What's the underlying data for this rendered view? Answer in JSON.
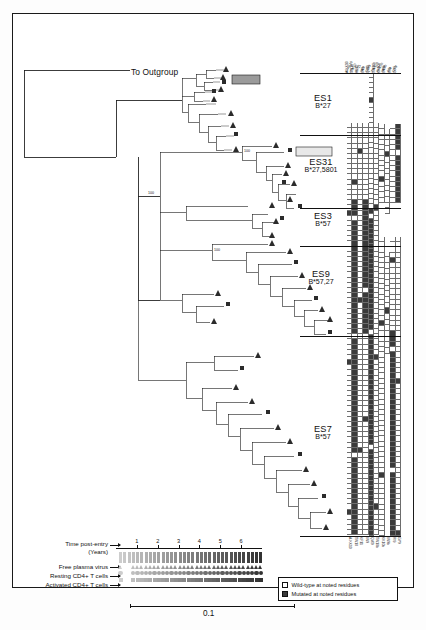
{
  "figure": {
    "type": "phylogenetic-tree-with-mutation-matrix",
    "outgroup_label": "To Outgroup",
    "bootstrap_values": [
      "100",
      "100",
      "100"
    ]
  },
  "groups": [
    {
      "id": "ES1",
      "name": "ES1",
      "hla": "B*27"
    },
    {
      "id": "ES31",
      "name": "ES31",
      "hla": "B*27,5801"
    },
    {
      "id": "ES3",
      "name": "ES3",
      "hla": "B*57"
    },
    {
      "id": "ES9",
      "name": "ES9",
      "hla": "B*57,27"
    },
    {
      "id": "ES7",
      "name": "ES7",
      "hla": "B*57"
    }
  ],
  "matrix": {
    "columns": [
      "A-KK10",
      "TW10",
      "KF11",
      "IW9",
      "QW9",
      "TW10b",
      "KK10b",
      "IW9b",
      "RI9",
      "GY9"
    ],
    "footer_columns": [
      "A-KK10",
      "TW10",
      "KF11",
      "IW9",
      "QW9",
      "TW10b",
      "KK10b",
      "IW9b",
      "RI9",
      "GY9"
    ],
    "legend": {
      "wild_type": "Wild-type at noted residues",
      "mutated": "Mutated at noted residues"
    },
    "colors": {
      "wild_type": "#ffffff",
      "mutated": "#3a3a3a",
      "grid": "#6d6d6d"
    }
  },
  "timeline": {
    "title_line1": "Time post-entry",
    "title_line2": "(Years)",
    "ticks": [
      "1",
      "2",
      "3",
      "4",
      "5",
      "6"
    ],
    "rows": [
      {
        "label": "Free plasma virus",
        "symbol": "triangle"
      },
      {
        "label": "Resting CD4+ T cells",
        "symbol": "circle"
      },
      {
        "label": "Activated CD4+ T cells",
        "symbol": "square"
      }
    ]
  },
  "scale_bar": {
    "value": "0.1"
  }
}
